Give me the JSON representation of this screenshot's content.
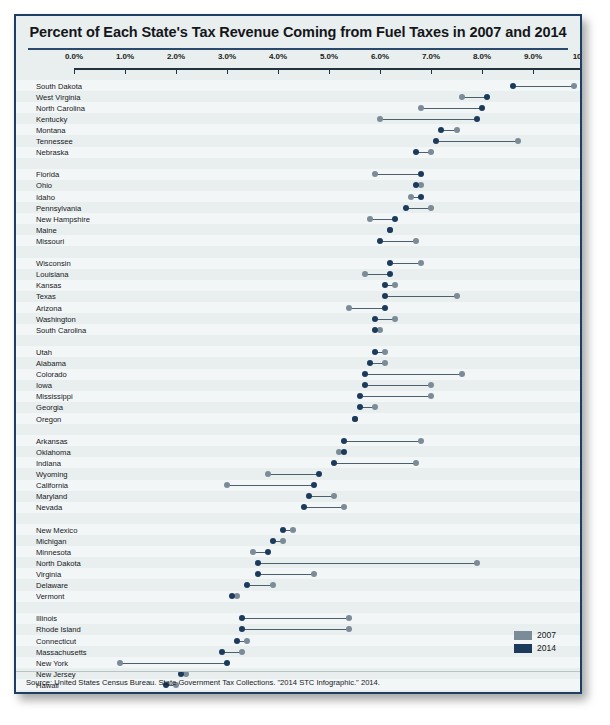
{
  "title": "Percent of Each State's Tax Revenue Coming from Fuel Taxes in 2007 and 2014",
  "source": "Source: United States Census Bureau. State Government Tax Collections. \"2014 STC Infographic.\" 2014.",
  "legend": {
    "items": [
      {
        "label": "2007",
        "color": "#7b8b97"
      },
      {
        "label": "2014",
        "color": "#1b3a5c"
      }
    ]
  },
  "colors": {
    "color_2007": "#7b8b97",
    "color_2014": "#1b3a5c",
    "frame": "#1c3f63",
    "background": "#e9eeee"
  },
  "chart_data": {
    "type": "scatter",
    "subtype": "dumbbell",
    "title": "Percent of Each State's Tax Revenue Coming from Fuel Taxes in 2007 and 2014",
    "xlabel": "",
    "ylabel": "",
    "xlim": [
      0.0,
      10.0
    ],
    "xticks": [
      "0.0%",
      "1.0%",
      "2.0%",
      "3.0%",
      "4.0%",
      "5.0%",
      "6.0%",
      "7.0%",
      "8.0%",
      "9.0%",
      "10.0%"
    ],
    "xtick_values": [
      0,
      1,
      2,
      3,
      4,
      5,
      6,
      7,
      8,
      9,
      10
    ],
    "grid": false,
    "legend_position": "bottom-right",
    "series": [
      {
        "name": "2007",
        "color": "#7b8b97"
      },
      {
        "name": "2014",
        "color": "#1b3a5c"
      }
    ],
    "categories": [
      "South Dakota",
      "West Virginia",
      "North Carolina",
      "Kentucky",
      "Montana",
      "Tennessee",
      "Nebraska",
      "",
      "Florida",
      "Ohio",
      "Idaho",
      "Pennsylvania",
      "New Hampshire",
      "Maine",
      "Missouri",
      "",
      "Wisconsin",
      "Louisiana",
      "Kansas",
      "Texas",
      "Arizona",
      "Washington",
      "South Carolina",
      "",
      "Utah",
      "Alabama",
      "Colorado",
      "Iowa",
      "Mississippi",
      "Georgia",
      "Oregon",
      "",
      "Arkansas",
      "Oklahoma",
      "Indiana",
      "Wyoming",
      "California",
      "Maryland",
      "Nevada",
      "",
      "New Mexico",
      "Michigan",
      "Minnesota",
      "North Dakota",
      "Virginia",
      "Delaware",
      "Vermont",
      "",
      "Illinois",
      "Rhode Island",
      "Connecticut",
      "Massachusetts",
      "New York",
      "New Jersey",
      "Hawaii",
      "Alaska"
    ],
    "rows": [
      {
        "state": "South Dakota",
        "v2007": 9.8,
        "v2014": 8.6
      },
      {
        "state": "West Virginia",
        "v2007": 7.6,
        "v2014": 8.1
      },
      {
        "state": "North Carolina",
        "v2007": 6.8,
        "v2014": 8.0
      },
      {
        "state": "Kentucky",
        "v2007": 6.0,
        "v2014": 7.9
      },
      {
        "state": "Montana",
        "v2007": 7.5,
        "v2014": 7.2
      },
      {
        "state": "Tennessee",
        "v2007": 8.7,
        "v2014": 7.1
      },
      {
        "state": "Nebraska",
        "v2007": 7.0,
        "v2014": 6.7
      },
      {
        "state": "",
        "v2007": null,
        "v2014": null
      },
      {
        "state": "Florida",
        "v2007": 5.9,
        "v2014": 6.8
      },
      {
        "state": "Ohio",
        "v2007": 6.8,
        "v2014": 6.7
      },
      {
        "state": "Idaho",
        "v2007": 6.6,
        "v2014": 6.8
      },
      {
        "state": "Pennsylvania",
        "v2007": 7.0,
        "v2014": 6.5
      },
      {
        "state": "New Hampshire",
        "v2007": 5.8,
        "v2014": 6.3
      },
      {
        "state": "Maine",
        "v2007": 6.2,
        "v2014": 6.2
      },
      {
        "state": "Missouri",
        "v2007": 6.7,
        "v2014": 6.0
      },
      {
        "state": "",
        "v2007": null,
        "v2014": null
      },
      {
        "state": "Wisconsin",
        "v2007": 6.8,
        "v2014": 6.2
      },
      {
        "state": "Louisiana",
        "v2007": 5.7,
        "v2014": 6.2
      },
      {
        "state": "Kansas",
        "v2007": 6.3,
        "v2014": 6.1
      },
      {
        "state": "Texas",
        "v2007": 7.5,
        "v2014": 6.1
      },
      {
        "state": "Arizona",
        "v2007": 5.4,
        "v2014": 6.1
      },
      {
        "state": "Washington",
        "v2007": 6.3,
        "v2014": 5.9
      },
      {
        "state": "South Carolina",
        "v2007": 6.0,
        "v2014": 5.9
      },
      {
        "state": "",
        "v2007": null,
        "v2014": null
      },
      {
        "state": "Utah",
        "v2007": 6.1,
        "v2014": 5.9
      },
      {
        "state": "Alabama",
        "v2007": 6.1,
        "v2014": 5.8
      },
      {
        "state": "Colorado",
        "v2007": 7.6,
        "v2014": 5.7
      },
      {
        "state": "Iowa",
        "v2007": 7.0,
        "v2014": 5.7
      },
      {
        "state": "Mississippi",
        "v2007": 7.0,
        "v2014": 5.6
      },
      {
        "state": "Georgia",
        "v2007": 5.9,
        "v2014": 5.6
      },
      {
        "state": "Oregon",
        "v2007": 5.5,
        "v2014": 5.5
      },
      {
        "state": "",
        "v2007": null,
        "v2014": null
      },
      {
        "state": "Arkansas",
        "v2007": 6.8,
        "v2014": 5.3
      },
      {
        "state": "Oklahoma",
        "v2007": 5.2,
        "v2014": 5.3
      },
      {
        "state": "Indiana",
        "v2007": 6.7,
        "v2014": 5.1
      },
      {
        "state": "Wyoming",
        "v2007": 3.8,
        "v2014": 4.8
      },
      {
        "state": "California",
        "v2007": 3.0,
        "v2014": 4.7
      },
      {
        "state": "Maryland",
        "v2007": 5.1,
        "v2014": 4.6
      },
      {
        "state": "Nevada",
        "v2007": 5.3,
        "v2014": 4.5
      },
      {
        "state": "",
        "v2007": null,
        "v2014": null
      },
      {
        "state": "New Mexico",
        "v2007": 4.3,
        "v2014": 4.1
      },
      {
        "state": "Michigan",
        "v2007": 4.1,
        "v2014": 3.9
      },
      {
        "state": "Minnesota",
        "v2007": 3.5,
        "v2014": 3.8
      },
      {
        "state": "North Dakota",
        "v2007": 7.9,
        "v2014": 3.6
      },
      {
        "state": "Virginia",
        "v2007": 4.7,
        "v2014": 3.6
      },
      {
        "state": "Delaware",
        "v2007": 3.9,
        "v2014": 3.4
      },
      {
        "state": "Vermont",
        "v2007": 3.2,
        "v2014": 3.1
      },
      {
        "state": "",
        "v2007": null,
        "v2014": null
      },
      {
        "state": "Illinois",
        "v2007": 5.4,
        "v2014": 3.3
      },
      {
        "state": "Rhode Island",
        "v2007": 5.4,
        "v2014": 3.3
      },
      {
        "state": "Connecticut",
        "v2007": 3.4,
        "v2014": 3.2
      },
      {
        "state": "Massachusetts",
        "v2007": 3.3,
        "v2014": 2.9
      },
      {
        "state": "New York",
        "v2007": 0.9,
        "v2014": 3.0
      },
      {
        "state": "New Jersey",
        "v2007": 2.2,
        "v2014": 2.1
      },
      {
        "state": "Hawaii",
        "v2007": 2.0,
        "v2014": 1.8
      },
      {
        "state": "Alaska",
        "v2007": 1.3,
        "v2014": 1.6
      }
    ]
  }
}
